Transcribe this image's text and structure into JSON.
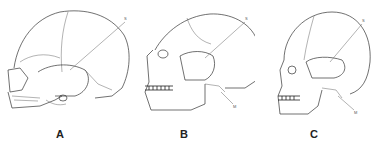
{
  "figure": {
    "panels": [
      {
        "letter": "A",
        "labels": {
          "upper": "S"
        }
      },
      {
        "letter": "B",
        "labels": {
          "upper": "S",
          "lower": "M"
        }
      },
      {
        "letter": "C",
        "labels": {
          "upper": "S",
          "lower": "M"
        }
      }
    ]
  },
  "colors": {
    "line": "#333333",
    "background": "#ffffff",
    "text": "#222222"
  }
}
